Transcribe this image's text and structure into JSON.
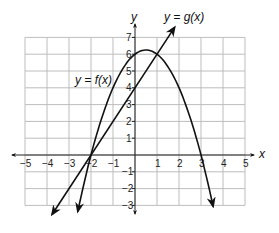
{
  "chart_data": {
    "type": "line",
    "title": "",
    "xlabel": "x",
    "ylabel": "y",
    "xlim": [
      -5,
      5
    ],
    "ylim": [
      -3,
      7
    ],
    "grid": true,
    "x_ticks": [
      "-5",
      "-4",
      "-3",
      "-2",
      "-1",
      "1",
      "2",
      "3",
      "4",
      "5"
    ],
    "y_ticks": [
      "7",
      "6",
      "5",
      "4",
      "3",
      "2",
      "1",
      "-1",
      "-2",
      "-3"
    ],
    "series": [
      {
        "name": "y = f(x)",
        "kind": "parabola",
        "equation": "f(x) = -x^2 + x + 6",
        "points": [
          [
            -2.6,
            -3.36
          ],
          [
            -2,
            0
          ],
          [
            -1,
            4
          ],
          [
            0,
            6
          ],
          [
            0.5,
            6.25
          ],
          [
            1,
            6
          ],
          [
            2,
            4
          ],
          [
            3,
            0
          ],
          [
            3.55,
            -3.05
          ]
        ]
      },
      {
        "name": "y = g(x)",
        "kind": "line",
        "equation": "g(x) = 2x + 4",
        "points": [
          [
            -3.77,
            -3.54
          ],
          [
            -2,
            0
          ],
          [
            0,
            4
          ],
          [
            1,
            6
          ],
          [
            1.8,
            7.6
          ]
        ]
      }
    ],
    "annotations": [
      {
        "text": "y = f(x)",
        "position": [
          -3.6,
          5
        ]
      },
      {
        "text": "y = g(x)",
        "position": [
          1.8,
          8
        ]
      }
    ]
  },
  "labels": {
    "f": "y = f(x)",
    "g": "y = g(x)",
    "x_axis": "x",
    "y_axis": "y"
  }
}
